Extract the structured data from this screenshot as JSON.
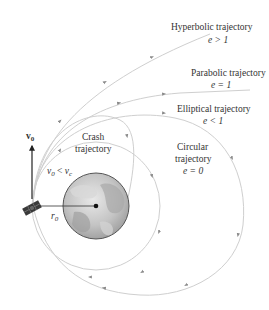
{
  "diagram": {
    "labels": {
      "hyperbolic": {
        "title": "Hyperbolic trajectory",
        "cond": "e > 1"
      },
      "parabolic": {
        "title": "Parabolic trajectory",
        "cond": "e = 1"
      },
      "elliptical": {
        "title": "Elliptical trajectory",
        "cond": "e < 1"
      },
      "circular": {
        "line1": "Circular",
        "line2": "trajectory",
        "cond": "e = 0"
      },
      "crash": {
        "line1": "Crash",
        "line2": "trajectory"
      },
      "velocity": {
        "symbol": "v",
        "sub": "0"
      },
      "speed_cond": {
        "lhs": "v",
        "lhs_sub": "0",
        "op": " < ",
        "rhs": "v",
        "rhs_sub": "c"
      },
      "radius": {
        "symbol": "r",
        "sub": "0"
      }
    },
    "colors": {
      "trajectory": "#cfcfcf",
      "arrow": "#8a8a8a",
      "text": "#333333",
      "earth": "#b8b8b8",
      "earth_outline": "#555555"
    }
  }
}
